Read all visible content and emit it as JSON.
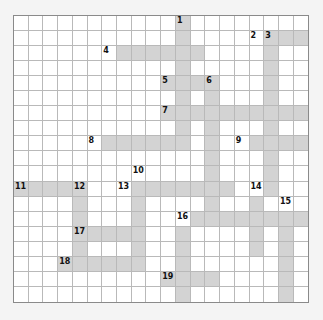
{
  "puzzle": {
    "cols": 20,
    "rows": 19,
    "colors": {
      "shaded": "#d3d3d3",
      "empty": "#ffffff",
      "border": "#8a8a8a",
      "gridline": "#b9b9b9"
    },
    "shaded_rows": [
      [
        11
      ],
      [
        11,
        17,
        18,
        19
      ],
      [
        7,
        8,
        9,
        10,
        11,
        12,
        17
      ],
      [
        11,
        17
      ],
      [
        10,
        11,
        12,
        13,
        17
      ],
      [
        11,
        13,
        17
      ],
      [
        10,
        11,
        12,
        13,
        14,
        15,
        16,
        17,
        18,
        19
      ],
      [
        11,
        13,
        17
      ],
      [
        6,
        7,
        8,
        9,
        10,
        11,
        13,
        16,
        17,
        18,
        19
      ],
      [
        13,
        17
      ],
      [
        13,
        17
      ],
      [
        0,
        1,
        2,
        3,
        4,
        8,
        9,
        10,
        11,
        12,
        13,
        14,
        17
      ],
      [
        4,
        8,
        13,
        16
      ],
      [
        4,
        8,
        12,
        13,
        14,
        15,
        16,
        17,
        18,
        19
      ],
      [
        4,
        5,
        6,
        7,
        8,
        11,
        16,
        18
      ],
      [
        4,
        8,
        11,
        16,
        18
      ],
      [
        3,
        4,
        5,
        6,
        7,
        8,
        11,
        18
      ],
      [
        10,
        11,
        12,
        13,
        18
      ],
      [
        11,
        18
      ]
    ],
    "numbers": [
      {
        "n": "1",
        "r": 0,
        "c": 11
      },
      {
        "n": "2",
        "r": 1,
        "c": 16
      },
      {
        "n": "3",
        "r": 1,
        "c": 17
      },
      {
        "n": "4",
        "r": 2,
        "c": 6
      },
      {
        "n": "5",
        "r": 4,
        "c": 10
      },
      {
        "n": "6",
        "r": 4,
        "c": 13
      },
      {
        "n": "7",
        "r": 6,
        "c": 10
      },
      {
        "n": "8",
        "r": 8,
        "c": 5
      },
      {
        "n": "9",
        "r": 8,
        "c": 15
      },
      {
        "n": "10",
        "r": 10,
        "c": 8
      },
      {
        "n": "11",
        "r": 11,
        "c": 0
      },
      {
        "n": "12",
        "r": 11,
        "c": 4
      },
      {
        "n": "13",
        "r": 11,
        "c": 7
      },
      {
        "n": "14",
        "r": 11,
        "c": 16
      },
      {
        "n": "15",
        "r": 12,
        "c": 18
      },
      {
        "n": "16",
        "r": 13,
        "c": 11
      },
      {
        "n": "17",
        "r": 14,
        "c": 4
      },
      {
        "n": "18",
        "r": 16,
        "c": 3
      },
      {
        "n": "19",
        "r": 17,
        "c": 10
      }
    ]
  }
}
